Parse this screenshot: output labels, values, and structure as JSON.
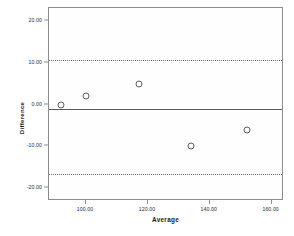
{
  "chart_data": {
    "type": "scatter",
    "title": "",
    "xlabel": "Average",
    "ylabel": "Difference",
    "xlim": [
      88,
      164
    ],
    "ylim": [
      -23,
      23
    ],
    "grid": false,
    "legend": "none",
    "xticks": [
      "100.00",
      "120.00",
      "140.00",
      "160.00"
    ],
    "xtick_values": [
      100,
      120,
      140,
      160
    ],
    "yticks": [
      "20.00",
      "10.00",
      "0.00",
      "-10.00",
      "-20.00"
    ],
    "ytick_values": [
      20,
      10,
      0,
      -10,
      -20
    ],
    "series": [
      {
        "name": "Difference vs Average",
        "marker": "open-circle",
        "points": [
          {
            "x": 92.0,
            "y": 0.0
          },
          {
            "x": 100.0,
            "y": 2.0
          },
          {
            "x": 117.0,
            "y": 5.0
          },
          {
            "x": 134.0,
            "y": -10.0
          },
          {
            "x": 152.0,
            "y": -6.0
          }
        ]
      }
    ],
    "reference_lines": [
      {
        "name": "upper-limit-of-agreement",
        "y": 10.5,
        "style": "dotted"
      },
      {
        "name": "mean-difference",
        "y": -1.0,
        "style": "solid"
      },
      {
        "name": "lower-limit-of-agreement",
        "y": -16.5,
        "style": "dotted"
      }
    ]
  }
}
